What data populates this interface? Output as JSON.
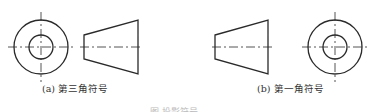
{
  "figures": [
    {
      "id": "a",
      "caption": "(a) 第三角符号",
      "layout": "circle-left, frustum-right",
      "circle_view": {
        "cx": 41,
        "cy": 42,
        "r_outer": 28,
        "r_inner": 12
      },
      "frustum_view": {
        "small_end_x": 84,
        "large_end_x": 138,
        "small_half_h": 11,
        "large_half_h": 27,
        "axis_y": 47
      }
    },
    {
      "id": "b",
      "caption": "(b) 第一角符号",
      "layout": "frustum-left, circle-right",
      "circle_view": {
        "cx": 335,
        "cy": 47,
        "r_outer": 27,
        "r_inner": 12
      },
      "frustum_view": {
        "small_end_x": 215,
        "large_end_x": 268,
        "small_half_h": 11,
        "large_half_h": 27,
        "axis_y": 47
      }
    }
  ],
  "figure_caption": "图 投影符号",
  "colors": {
    "line": "#2a2a2a",
    "background": "#ffffff"
  }
}
